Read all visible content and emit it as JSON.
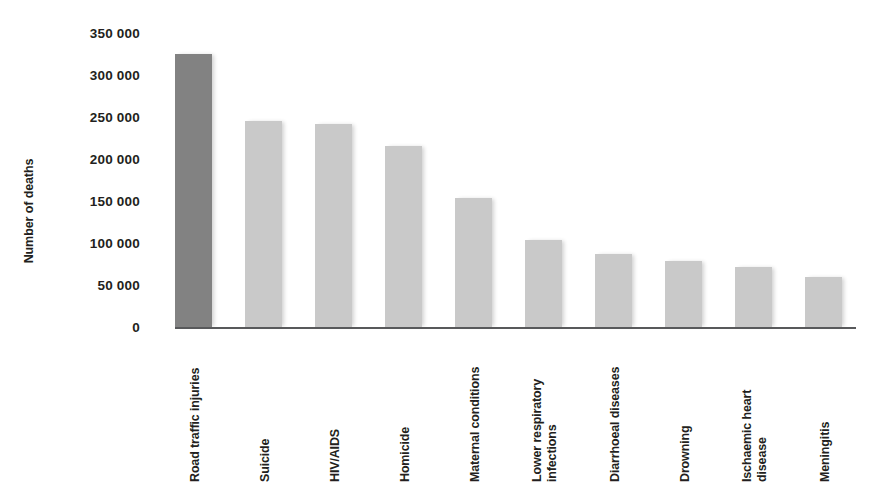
{
  "chart_data": {
    "type": "bar",
    "title": "",
    "xlabel": "",
    "ylabel": "Number of deaths",
    "ylim": [
      0,
      350000
    ],
    "grid": false,
    "legend": null,
    "ytick_labels": [
      "350 000",
      "300 000",
      "250 000",
      "200 000",
      "150 000",
      "100 000",
      "50 000",
      "0"
    ],
    "ytick_values": [
      350000,
      300000,
      250000,
      200000,
      150000,
      100000,
      50000,
      0
    ],
    "categories": [
      "Road traffic injuries",
      "Suicide",
      "HIV/AIDS",
      "Homicide",
      "Maternal conditions",
      "Lower respiratory\ninfections",
      "Diarrhoeal diseases",
      "Drowning",
      "Ischaemic heart\ndisease",
      "Meningitis"
    ],
    "values": [
      325000,
      245000,
      242000,
      215000,
      153000,
      103000,
      87000,
      78000,
      71000,
      59000
    ],
    "bar_colors": [
      "#828282",
      "#c9c9c9",
      "#c9c9c9",
      "#c9c9c9",
      "#c9c9c9",
      "#c9c9c9",
      "#c9c9c9",
      "#c9c9c9",
      "#c9c9c9",
      "#c9c9c9"
    ],
    "highlight_index": 0,
    "highlight_color": "#828282",
    "series_color": "#c9c9c9",
    "axis_color": "#58595b",
    "background_color": "#ffffff"
  }
}
